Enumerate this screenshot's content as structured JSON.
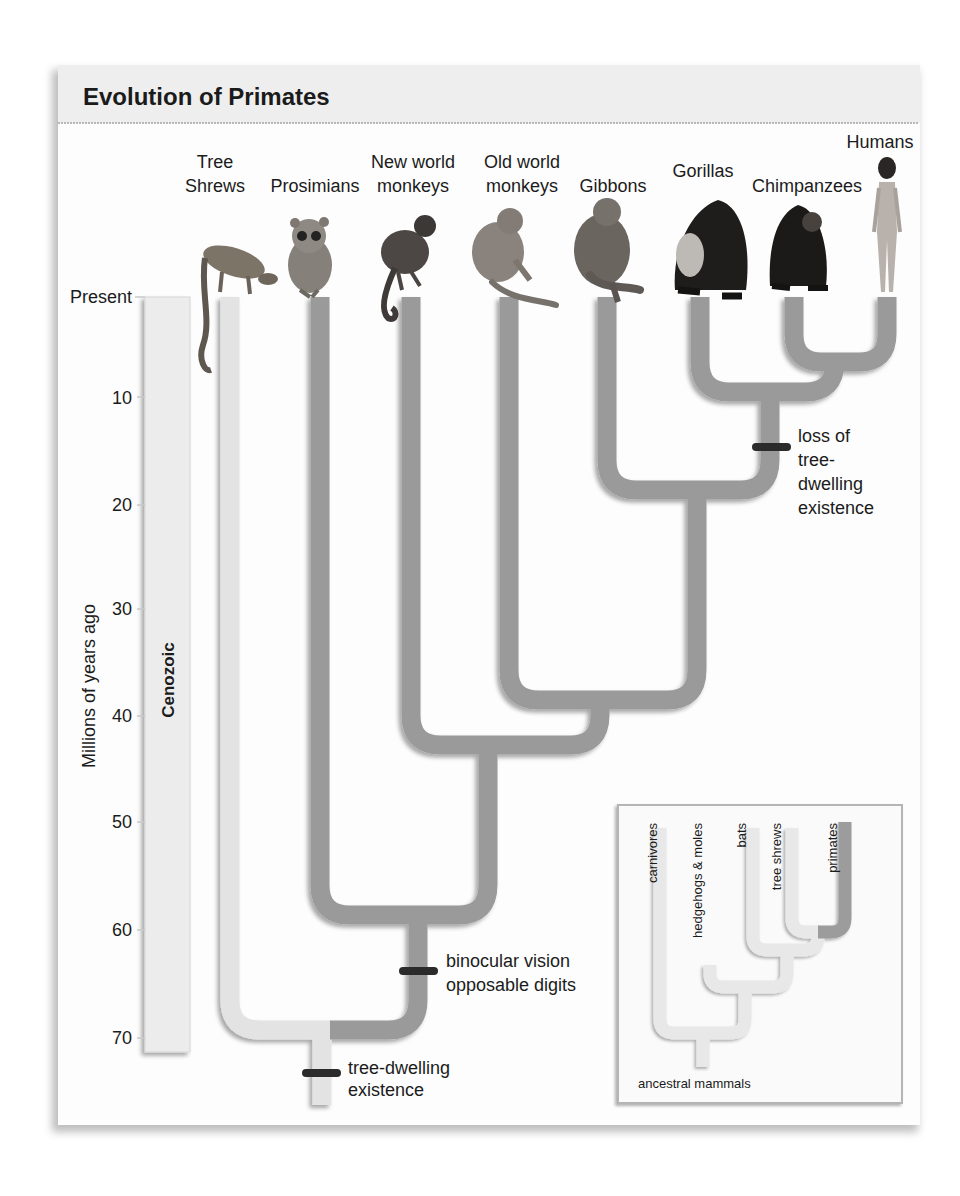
{
  "title": "Evolution of Primates",
  "taxa": [
    {
      "line1": "Tree",
      "line2": "Shrews"
    },
    {
      "line1": "",
      "line2": "Prosimians"
    },
    {
      "line1": "New world",
      "line2": "monkeys"
    },
    {
      "line1": "Old world",
      "line2": "monkeys"
    },
    {
      "line1": "",
      "line2": "Gibbons"
    },
    {
      "line1": "Gorillas",
      "line2": ""
    },
    {
      "line1": "",
      "line2": "Chimpanzees"
    },
    {
      "line1": "Humans",
      "line2": ""
    }
  ],
  "axis": {
    "label": "Millions of years ago",
    "era": "Cenozoic",
    "ticks": [
      "Present",
      "10",
      "20",
      "30",
      "40",
      "50",
      "60",
      "70"
    ]
  },
  "traits": {
    "loss_tree": [
      "loss of",
      "tree-",
      "dwelling",
      "existence"
    ],
    "binocular": [
      "binocular vision",
      "opposable digits"
    ],
    "tree_dwelling": [
      "tree-dwelling",
      "existence"
    ]
  },
  "inset": {
    "taxa": [
      "carnivores",
      "hedgehogs & moles",
      "bats",
      "tree shrews",
      "primates"
    ],
    "root": "ancestral mammals"
  },
  "colors": {
    "branch_primates": "#9a9a9a",
    "branch_other": "#e3e3e3",
    "trait_mark": "#2b2b2b",
    "header_band": "#eeeeee"
  }
}
